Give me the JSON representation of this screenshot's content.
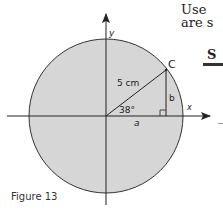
{
  "side_text": {
    "line1": "Use",
    "line2": "are s",
    "heading_fragment": "S"
  },
  "diagram": {
    "circle_fill": "#d6d6d6",
    "stroke_color": "#222222",
    "axis_labels": {
      "x": "x",
      "y": "y"
    },
    "point_label": "C",
    "radius_label": "5 cm",
    "angle_label": "38°",
    "opposite_label": "b",
    "adjacent_label": "a"
  },
  "caption": "Figure 13"
}
